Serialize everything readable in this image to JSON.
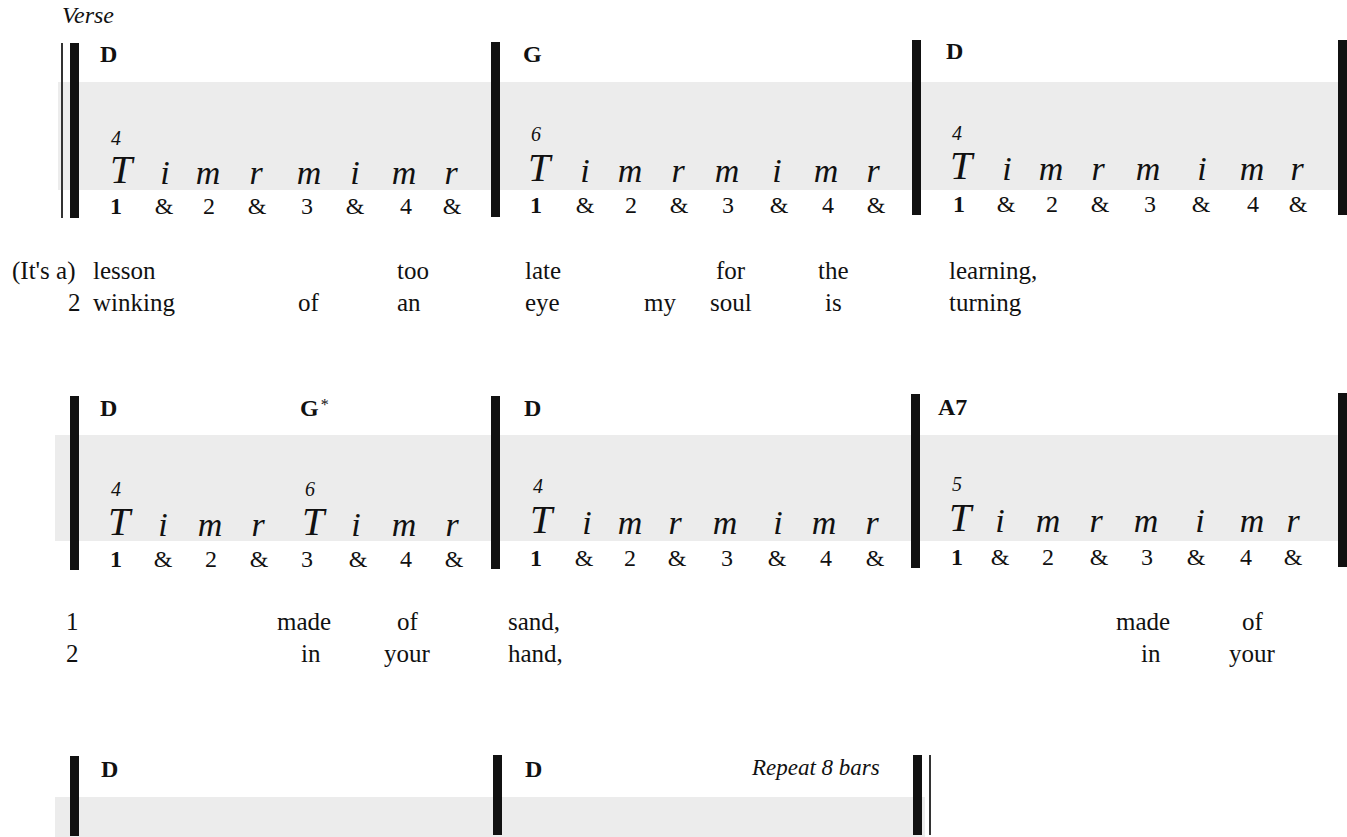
{
  "section_label": "Verse",
  "colors": {
    "band": "#ececec",
    "barline": "#111111",
    "text": "#111111"
  },
  "systems": [
    {
      "measures": [
        {
          "chords": [
            {
              "name": "D",
              "sup": ""
            }
          ],
          "frets": [
            "4"
          ],
          "fingering": [
            "T",
            "i",
            "m",
            "r",
            "m",
            "i",
            "m",
            "r"
          ],
          "counts": [
            "1",
            "&",
            "2",
            "&",
            "3",
            "&",
            "4",
            "&"
          ]
        },
        {
          "chords": [
            {
              "name": "G",
              "sup": ""
            }
          ],
          "frets": [
            "6"
          ],
          "fingering": [
            "T",
            "i",
            "m",
            "r",
            "m",
            "i",
            "m",
            "r"
          ],
          "counts": [
            "1",
            "&",
            "2",
            "&",
            "3",
            "&",
            "4",
            "&"
          ]
        },
        {
          "chords": [
            {
              "name": "D",
              "sup": ""
            }
          ],
          "frets": [
            "4"
          ],
          "fingering": [
            "T",
            "i",
            "m",
            "r",
            "m",
            "i",
            "m",
            "r"
          ],
          "counts": [
            "1",
            "&",
            "2",
            "&",
            "3",
            "&",
            "4",
            "&"
          ]
        }
      ],
      "lyrics": [
        [
          "(It's a)",
          "lesson",
          "too",
          "late",
          "for",
          "the",
          "learning,"
        ],
        [
          "2",
          "winking",
          "of",
          "an",
          "eye",
          "my",
          "soul",
          "is",
          "turning"
        ]
      ]
    },
    {
      "measures": [
        {
          "chords": [
            {
              "name": "D",
              "sup": ""
            },
            {
              "name": "G",
              "sup": "*"
            }
          ],
          "frets": [
            "4",
            "6"
          ],
          "fingering": [
            "T",
            "i",
            "m",
            "r",
            "T",
            "i",
            "m",
            "r"
          ],
          "counts": [
            "1",
            "&",
            "2",
            "&",
            "3",
            "&",
            "4",
            "&"
          ]
        },
        {
          "chords": [
            {
              "name": "D",
              "sup": ""
            }
          ],
          "frets": [
            "4"
          ],
          "fingering": [
            "T",
            "i",
            "m",
            "r",
            "m",
            "i",
            "m",
            "r"
          ],
          "counts": [
            "1",
            "&",
            "2",
            "&",
            "3",
            "&",
            "4",
            "&"
          ]
        },
        {
          "chords": [
            {
              "name": "A7",
              "sup": ""
            }
          ],
          "frets": [
            "5"
          ],
          "fingering": [
            "T",
            "i",
            "m",
            "r",
            "m",
            "i",
            "m",
            "r"
          ],
          "counts": [
            "1",
            "&",
            "2",
            "&",
            "3",
            "&",
            "4",
            "&"
          ]
        }
      ],
      "lyrics": [
        [
          "1",
          "made",
          "of",
          "sand,",
          "made",
          "of"
        ],
        [
          "2",
          "in",
          "your",
          "hand,",
          "in",
          "your"
        ]
      ]
    },
    {
      "measures": [
        {
          "chords": [
            {
              "name": "D",
              "sup": ""
            }
          ]
        },
        {
          "chords": [
            {
              "name": "D",
              "sup": ""
            }
          ],
          "annotation": "Repeat 8 bars"
        }
      ]
    }
  ]
}
